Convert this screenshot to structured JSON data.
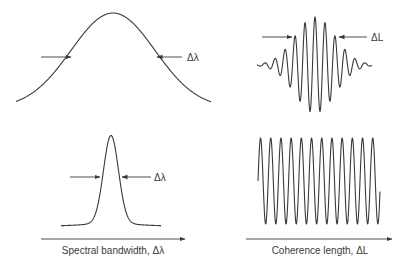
{
  "colors": {
    "ink": "#3a3a3a",
    "background": "#ffffff"
  },
  "panels": {
    "top_left": {
      "description": "Broad Gaussian spectrum",
      "width_label": "Δλ"
    },
    "top_right": {
      "description": "Short wave packet (short coherence length)",
      "width_label": "ΔL"
    },
    "bottom_left": {
      "description": "Narrow spectral peak",
      "width_label": "Δλ"
    },
    "bottom_right": {
      "description": "Long continuous sinusoid (long coherence length)"
    }
  },
  "axes": {
    "left": {
      "label": "Spectral bandwidth, Δλ"
    },
    "right": {
      "label": "Coherence length, ΔL"
    }
  }
}
